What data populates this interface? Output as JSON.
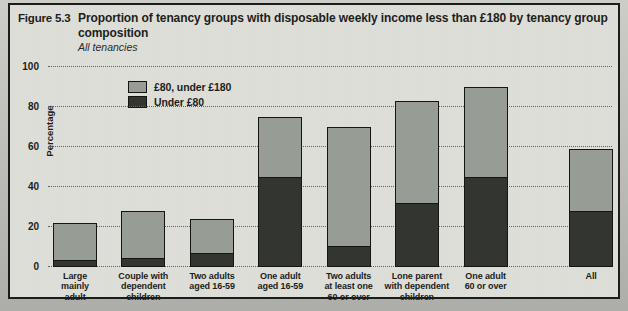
{
  "figure": {
    "label": "Figure 5.3",
    "title": "Proportion of tenancy groups with disposable weekly income less than £180 by tenancy group composition",
    "subtitle": "All tenancies"
  },
  "colors": {
    "page_bg": "#b7b8b3",
    "figure_bg": "#dcddd6",
    "light_band": "#979d95",
    "dark_band": "#333630",
    "grid": "#63635d",
    "text": "#1d1d1b"
  },
  "chart_data": {
    "type": "bar",
    "stacked": true,
    "title": "Proportion of tenancy groups with disposable weekly income less than £180 by tenancy group composition",
    "subtitle": "All tenancies",
    "xlabel": "",
    "ylabel": "Percentage",
    "ylim": [
      0,
      100
    ],
    "yticks": [
      0,
      20,
      40,
      60,
      80,
      100
    ],
    "grid": "horizontal dotted",
    "legend_position": "upper-left inside plot",
    "legend": [
      {
        "label": "£80, under £180",
        "color_key": "light_band"
      },
      {
        "label": "Under £80",
        "color_key": "dark_band"
      }
    ],
    "categories": [
      "Large mainly adult",
      "Couple with dependent children",
      "Two adults aged 16-59",
      "One adult aged 16-59",
      "Two adults at least one 60 or over",
      "Lone parent with dependent children",
      "One adult 60 or over",
      "All"
    ],
    "category_lines": [
      [
        "Large",
        "mainly",
        "adult"
      ],
      [
        "Couple with",
        "dependent",
        "children"
      ],
      [
        "Two adults",
        "aged 16-59"
      ],
      [
        "One adult",
        "aged 16-59"
      ],
      [
        "Two adults",
        "at least one",
        "60 or over"
      ],
      [
        "Lone parent",
        "with dependent",
        "children"
      ],
      [
        "One adult",
        "60 or over"
      ],
      [
        "All"
      ]
    ],
    "series": [
      {
        "name": "Under £80",
        "values": [
          3,
          4,
          7,
          45,
          10,
          32,
          45,
          28
        ]
      },
      {
        "name": "£80, under £180",
        "values": [
          19,
          24,
          17,
          30,
          60,
          51,
          45,
          31
        ]
      }
    ],
    "totals": [
      22,
      28,
      24,
      75,
      70,
      83,
      90,
      59
    ],
    "layout": {
      "x_centers_pct": [
        4.8,
        16.9,
        29.1,
        41.2,
        53.3,
        65.4,
        77.6,
        96.3
      ],
      "bar_width_pct": 7.8
    }
  }
}
